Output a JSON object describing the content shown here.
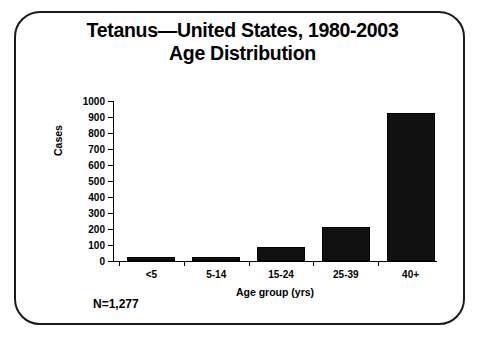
{
  "chart_data": {
    "type": "bar",
    "title": "Tetanus—United States, 1980-2003",
    "subtitle": "Age Distribution",
    "title_line1": "Tetanus—United States, 1980-2003",
    "title_line2": "Age Distribution",
    "xlabel": "Age group (yrs)",
    "ylabel": "Cases",
    "categories": [
      "<5",
      "5-14",
      "15-24",
      "25-39",
      "40+"
    ],
    "values": [
      25,
      25,
      85,
      215,
      925
    ],
    "ylim": [
      0,
      1000
    ],
    "ytick_labels": [
      "1000",
      "900",
      "800",
      "700",
      "600",
      "500",
      "400",
      "300",
      "200",
      "100",
      "0"
    ],
    "ytick_values": [
      1000,
      900,
      800,
      700,
      600,
      500,
      400,
      300,
      200,
      100,
      0
    ],
    "ytick_step": 100,
    "grid": false,
    "legend": null,
    "annotation": "N=1,277",
    "bar_color": "#111111",
    "axis_color": "#000000",
    "background_color": "#ffffff",
    "frame_color": "#1a1a1a"
  }
}
